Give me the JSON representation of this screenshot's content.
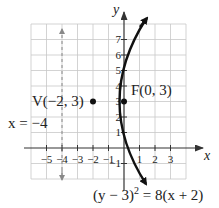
{
  "diagram": {
    "type": "parabola-graph",
    "equation": "(y − 3)² = 8(x + 2)",
    "equation_parts": {
      "left": "(y − 3)",
      "exp": "2",
      "right": " = 8(x + 2)"
    },
    "vertex": {
      "label": "V(−2, 3)",
      "x": -2,
      "y": 3
    },
    "focus": {
      "label": "F(0, 3)",
      "x": 0,
      "y": 3
    },
    "directrix": {
      "label": "x = −4",
      "x": -4
    },
    "axes": {
      "x_label": "x",
      "y_label": "y"
    },
    "x_ticks": [
      "−5",
      "−4",
      "−3",
      "−2",
      "−1",
      "1",
      "2",
      "3"
    ],
    "y_ticks": [
      "1",
      "2",
      "3",
      "4",
      "5",
      "6",
      "7"
    ],
    "y_neg_tick": "−1",
    "grid": {
      "x_range": [
        -6,
        4
      ],
      "y_range": [
        -2,
        8
      ]
    },
    "colors": {
      "grid": "#c8c8c8",
      "axis": "#333333",
      "curve": "#111111",
      "directrix": "#888888"
    }
  }
}
